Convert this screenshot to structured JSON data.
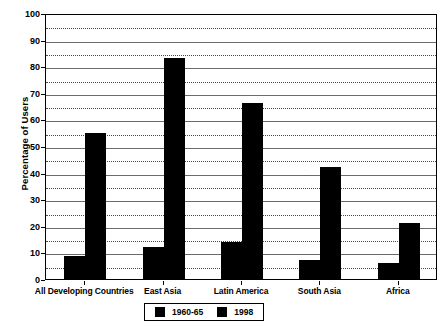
{
  "chart_data": {
    "type": "bar",
    "title": "",
    "xlabel": "",
    "ylabel": "Percentage of Users",
    "ylim": [
      0,
      100
    ],
    "ytick_step": 10,
    "yminor_step": 5,
    "grid": true,
    "legend_position": "bottom",
    "categories": [
      "All Developing Countries",
      "East Asia",
      "Latin America",
      "South Asia",
      "Africa"
    ],
    "yticks": [
      "0",
      "10",
      "20",
      "30",
      "40",
      "50",
      "60",
      "70",
      "80",
      "90",
      "100"
    ],
    "series": [
      {
        "name": "1960-65",
        "color": "#000000",
        "values": [
          8.5,
          12,
          14,
          7,
          6
        ]
      },
      {
        "name": "1998",
        "color": "#000000",
        "values": [
          55,
          83,
          66,
          42,
          21
        ]
      }
    ]
  },
  "legend": {
    "entries": [
      {
        "label": "1960-65",
        "swatch": "legend-swatch-icon"
      },
      {
        "label": "1998",
        "swatch": "legend-swatch-icon"
      }
    ]
  }
}
